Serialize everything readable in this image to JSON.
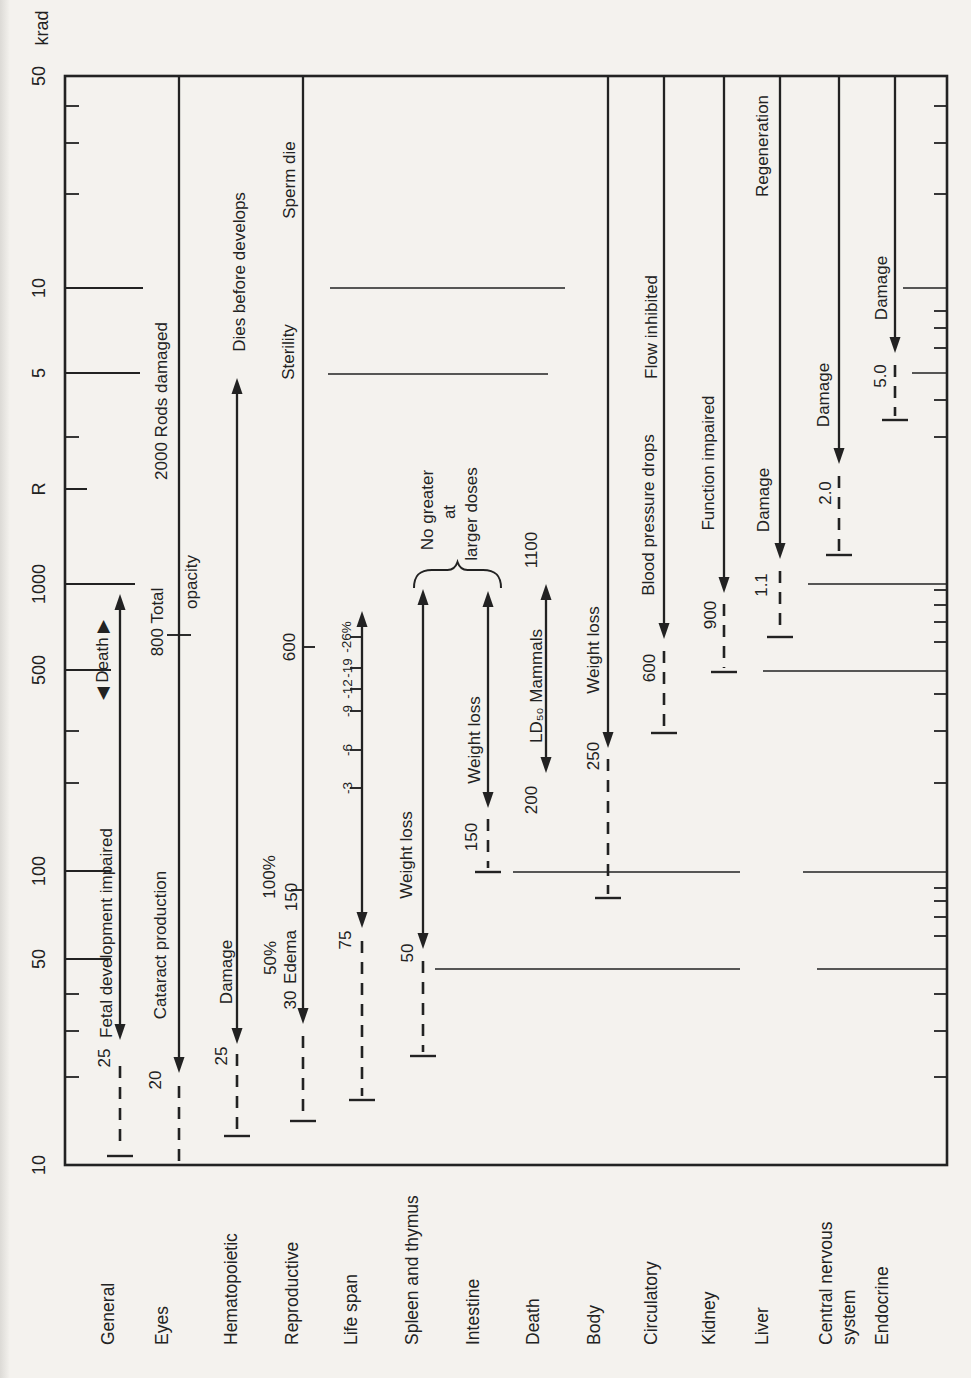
{
  "style": {
    "ink": "#222222",
    "paper": "#f4f2ee"
  },
  "chart_data": {
    "type": "bar",
    "variant": "horizontal-log-dose-range-figure-rotated-90ccw",
    "title": "",
    "xlabel": "",
    "ylabel": "Dose (R / krad), log scale",
    "axis": {
      "scale": "log",
      "range_R": [
        10,
        50000
      ],
      "label_x": 39,
      "frame": {
        "left": 65,
        "right": 947,
        "top": 76,
        "bottom": 1165
      },
      "unit_labels": [
        {
          "label": "krad",
          "x": 42,
          "y": 28
        }
      ],
      "left_ticks": [
        {
          "label": "50",
          "value_R": 50000,
          "y": 76,
          "len": 0
        },
        {
          "label": "10",
          "value_R": 10000,
          "y": 288,
          "len": 78
        },
        {
          "label": "5",
          "value_R": 5000,
          "y": 373,
          "len": 75
        },
        {
          "label": "R",
          "value_R": 2000,
          "y": 489,
          "len": 22
        },
        {
          "label": "1000",
          "value_R": 1000,
          "y": 584,
          "len": 70
        },
        {
          "label": "500",
          "value_R": 500,
          "y": 670,
          "len": 46
        },
        {
          "label": "100",
          "value_R": 100,
          "y": 871,
          "len": 46
        },
        {
          "label": "50",
          "value_R": 50,
          "y": 959,
          "len": 46
        },
        {
          "label": "10",
          "value_R": 10,
          "y": 1165,
          "len": 0
        }
      ],
      "left_minor_ticks": [
        106,
        143,
        194,
        437,
        731,
        783,
        994,
        1031,
        1077
      ],
      "right_minor_ticks": [
        106,
        143,
        194,
        311,
        328,
        348,
        400,
        437,
        590,
        605,
        622,
        642,
        694,
        731,
        783,
        888,
        901,
        917,
        936,
        994,
        1031,
        1077
      ]
    },
    "gridline_segments": [
      {
        "value_R": 10000,
        "y": 288,
        "x1": 330,
        "x2": 565
      },
      {
        "value_R": 5000,
        "y": 374,
        "x1": 328,
        "x2": 548
      },
      {
        "value_R": 100,
        "y": 872,
        "x1": 513,
        "x2": 740
      },
      {
        "value_R": 50,
        "y": 969,
        "x1": 435,
        "x2": 740
      },
      {
        "value_R": 1000,
        "y": 584,
        "x1": 808,
        "x2": 947
      },
      {
        "value_R": 500,
        "y": 671,
        "x1": 763,
        "x2": 947
      },
      {
        "value_R": 100,
        "y": 872,
        "x1": 803,
        "x2": 947
      },
      {
        "value_R": 50,
        "y": 969,
        "x1": 817,
        "x2": 947
      },
      {
        "value_R": 10000,
        "y": 288,
        "x1": 903,
        "x2": 947
      },
      {
        "value_R": 5000,
        "y": 373,
        "x1": 912,
        "x2": 947
      }
    ],
    "category_baseline_y": 1345,
    "systems": [
      {
        "name": "General",
        "name_lines": [
          "General"
        ],
        "label_x": 108,
        "line_x": 120,
        "threshold_R": 25,
        "upper_R": 1000,
        "range_arrow": {
          "y1": 594,
          "y2": 1040
        },
        "dash": {
          "y1": 1066,
          "y2": 1150
        },
        "cap": 1156,
        "labels": [
          {
            "text": "25",
            "x": 104,
            "y": 1058
          },
          {
            "text": "Fetal development impaired",
            "x": 106,
            "y": 933
          },
          {
            "text": "◀ Death ▶",
            "x": 102,
            "y": 660
          }
        ]
      },
      {
        "name": "Eyes",
        "name_lines": [
          "Eyes"
        ],
        "label_x": 162,
        "line_x": 179,
        "threshold_R": 20,
        "solid": {
          "y1": 76,
          "y2": 1073,
          "head_bottom": true
        },
        "dash": {
          "y1": 1086,
          "y2": 1163
        },
        "ticks": [
          {
            "y": 635,
            "side": "both"
          }
        ],
        "labels": [
          {
            "text": "20",
            "x": 155,
            "y": 1080
          },
          {
            "text": "Cataract production",
            "x": 160,
            "y": 945
          },
          {
            "text": "800 Total",
            "x": 157,
            "y": 622
          },
          {
            "text": "opacity",
            "x": 191,
            "y": 582
          },
          {
            "text": "2000 Rods damaged",
            "x": 161,
            "y": 401
          }
        ]
      },
      {
        "name": "Hematopoietic",
        "name_lines": [
          "Hematopoietic"
        ],
        "label_x": 231,
        "line_x": 237,
        "threshold_R": 25,
        "upper_R": 5000,
        "range_arrow": {
          "y1": 378,
          "y2": 1044
        },
        "dash": {
          "y1": 1054,
          "y2": 1132
        },
        "cap": 1136,
        "labels": [
          {
            "text": "25",
            "x": 221,
            "y": 1056
          },
          {
            "text": "Damage",
            "x": 226,
            "y": 972
          },
          {
            "text": "Dies before develops",
            "x": 239,
            "y": 272
          }
        ]
      },
      {
        "name": "Reproductive",
        "name_lines": [
          "Reproductive"
        ],
        "label_x": 292,
        "line_x": 303,
        "threshold_R": 30,
        "solid": {
          "y1": 76,
          "y2": 1024,
          "head_bottom": true
        },
        "dash": {
          "y1": 1036,
          "y2": 1117
        },
        "cap": 1121,
        "ticks": [
          {
            "y": 647,
            "side": "right"
          },
          {
            "y": 890,
            "side": "left"
          }
        ],
        "labels": [
          {
            "text": "30",
            "x": 290,
            "y": 1000
          },
          {
            "text": "50%",
            "x": 270,
            "y": 958
          },
          {
            "text": "Edema",
            "x": 290,
            "y": 957
          },
          {
            "text": "100%",
            "x": 269,
            "y": 877
          },
          {
            "text": "150",
            "x": 291,
            "y": 897
          },
          {
            "text": "600",
            "x": 289,
            "y": 647
          },
          {
            "text": "Sterility",
            "x": 288,
            "y": 352
          },
          {
            "text": "Sperm die",
            "x": 289,
            "y": 180
          }
        ]
      },
      {
        "name": "Life span",
        "name_lines": [
          "Life span"
        ],
        "label_x": 351,
        "line_x": 362,
        "threshold_R": 75,
        "range_arrow": {
          "y1": 611,
          "y2": 928
        },
        "dash": {
          "y1": 941,
          "y2": 1096
        },
        "cap": 1100,
        "ticks": [
          {
            "y": 637,
            "side": "left",
            "label": "-26%",
            "label_x": 346
          },
          {
            "y": 668,
            "side": "left",
            "label": "-19",
            "label_x": 347
          },
          {
            "y": 689,
            "side": "left",
            "label": "-12",
            "label_x": 347
          },
          {
            "y": 711,
            "side": "left",
            "label": "-9",
            "label_x": 347
          },
          {
            "y": 750,
            "side": "left",
            "label": "-6",
            "label_x": 347
          },
          {
            "y": 788,
            "side": "left",
            "label": "-3",
            "label_x": 347
          }
        ],
        "labels": [
          {
            "text": "75",
            "x": 345,
            "y": 940
          }
        ]
      },
      {
        "name": "Spleen and thymus",
        "name_lines": [
          "Spleen and thymus"
        ],
        "label_x": 412,
        "line_x": 423,
        "threshold_R": 50,
        "upper_R": 700,
        "range_arrow": {
          "y1": 589,
          "y2": 949
        },
        "dash": {
          "y1": 961,
          "y2": 1052
        },
        "cap": 1056,
        "labels": [
          {
            "text": "50",
            "x": 407,
            "y": 953
          },
          {
            "text": "Weight loss",
            "x": 406,
            "y": 855
          }
        ]
      },
      {
        "name": "Intestine",
        "name_lines": [
          "Intestine"
        ],
        "label_x": 473,
        "line_x": 488,
        "threshold_R": 150,
        "upper_R": 700,
        "range_arrow": {
          "y1": 591,
          "y2": 808
        },
        "dash": {
          "y1": 819,
          "y2": 868
        },
        "cap": 872,
        "labels": [
          {
            "text": "150",
            "x": 471,
            "y": 837
          },
          {
            "text": "Weight loss",
            "x": 474,
            "y": 740
          }
        ]
      },
      {
        "name": "Death",
        "name_lines": [
          "Death"
        ],
        "label_x": 533,
        "line_x": 546,
        "threshold_R": 200,
        "upper_R": 1100,
        "range_arrow": {
          "y1": 584,
          "y2": 773
        },
        "labels": [
          {
            "text": "1100",
            "x": 531,
            "y": 550
          },
          {
            "text": "200",
            "x": 531,
            "y": 800
          },
          {
            "text": "LD₅₀ Mammals",
            "x": 536,
            "y": 686
          }
        ]
      },
      {
        "name": "Body",
        "name_lines": [
          "Body"
        ],
        "label_x": 594,
        "line_x": 608,
        "threshold_R": 250,
        "solid": {
          "y1": 76,
          "y2": 748,
          "head_bottom": true
        },
        "dash": {
          "y1": 759,
          "y2": 894
        },
        "cap": 898,
        "labels": [
          {
            "text": "250",
            "x": 593,
            "y": 756
          },
          {
            "text": "Weight loss",
            "x": 593,
            "y": 650
          }
        ]
      },
      {
        "name": "Circulatory",
        "name_lines": [
          "Circulatory"
        ],
        "label_x": 651,
        "line_x": 664,
        "threshold_R": 600,
        "solid": {
          "y1": 76,
          "y2": 639,
          "head_bottom": true
        },
        "dash": {
          "y1": 651,
          "y2": 729
        },
        "cap": 733,
        "labels": [
          {
            "text": "600",
            "x": 649,
            "y": 668
          },
          {
            "text": "Blood pressure drops",
            "x": 648,
            "y": 515
          },
          {
            "text": "Flow inhibited",
            "x": 651,
            "y": 327
          }
        ]
      },
      {
        "name": "Kidney",
        "name_lines": [
          "Kidney"
        ],
        "label_x": 709,
        "line_x": 724,
        "threshold_R": 900,
        "solid": {
          "y1": 76,
          "y2": 593,
          "head_bottom": true
        },
        "dash": {
          "y1": 604,
          "y2": 668
        },
        "cap": 672,
        "labels": [
          {
            "text": "900",
            "x": 710,
            "y": 615
          },
          {
            "text": "Function impaired",
            "x": 708,
            "y": 463
          }
        ]
      },
      {
        "name": "Liver",
        "name_lines": [
          "Liver"
        ],
        "label_x": 762,
        "line_x": 780,
        "threshold_R": 1100,
        "solid": {
          "y1": 76,
          "y2": 559,
          "head_bottom": true
        },
        "dash": {
          "y1": 571,
          "y2": 633
        },
        "cap": 637,
        "labels": [
          {
            "text": "1.1",
            "x": 761,
            "y": 585
          },
          {
            "text": "Damage",
            "x": 763,
            "y": 500
          },
          {
            "text": "Regeneration",
            "x": 762,
            "y": 146
          }
        ]
      },
      {
        "name": "Central nervous system",
        "name_lines": [
          "Central nervous",
          "system"
        ],
        "label_x": 826,
        "line_x": 839,
        "threshold_R": 2000,
        "solid": {
          "y1": 76,
          "y2": 464,
          "head_bottom": true
        },
        "dash": {
          "y1": 476,
          "y2": 551
        },
        "cap": 555,
        "labels": [
          {
            "text": "2.0",
            "x": 825,
            "y": 493
          },
          {
            "text": "Damage",
            "x": 823,
            "y": 395
          }
        ]
      },
      {
        "name": "Endocrine",
        "name_lines": [
          "Endocrine"
        ],
        "label_x": 882,
        "line_x": 895,
        "threshold_R": 5000,
        "solid": {
          "y1": 76,
          "y2": 353,
          "head_bottom": true
        },
        "dash": {
          "y1": 365,
          "y2": 416
        },
        "cap": 420,
        "labels": [
          {
            "text": "5.0",
            "x": 880,
            "y": 376
          },
          {
            "text": "Damage",
            "x": 881,
            "y": 288
          }
        ]
      }
    ],
    "brace": {
      "x1": 414,
      "x2": 501,
      "y_top": 566,
      "y_end": 588,
      "labels": [
        {
          "text": "No greater",
          "x": 427,
          "y": 510
        },
        {
          "text": "at",
          "x": 449,
          "y": 512
        },
        {
          "text": "larger doses",
          "x": 471,
          "y": 514
        }
      ]
    }
  }
}
